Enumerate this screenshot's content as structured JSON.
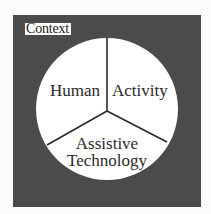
{
  "diagram": {
    "type": "context-pie",
    "container": {
      "label": "Context",
      "fill": "#4b4b4b"
    },
    "circle": {
      "fill": "#ffffff",
      "stroke": "#2a2a2a",
      "segments": [
        {
          "label": "Human",
          "position": "upper-left"
        },
        {
          "label": "Activity",
          "position": "upper-right"
        },
        {
          "label_line1": "Assistive",
          "label_line2": "Technology",
          "position": "bottom"
        }
      ]
    }
  }
}
